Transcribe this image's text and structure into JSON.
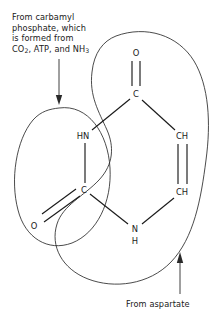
{
  "figure": {
    "background_color": "#ffffff",
    "ink_color": "#1a1a1a"
  },
  "captions": {
    "top": {
      "line1": "From carbamyl",
      "line2": "phosphate, which",
      "line3": "is formed from",
      "line4_pre": "CO",
      "line4_sub1": "2",
      "line4_mid": ", ATP, and NH",
      "line4_sub2": "3"
    },
    "bottom": {
      "text": "From aspartate"
    }
  },
  "structure": {
    "atoms": [
      {
        "id": "O-top",
        "label": "O",
        "x": 136,
        "y": 53
      },
      {
        "id": "C-top",
        "label": "C",
        "x": 136,
        "y": 94
      },
      {
        "id": "HN",
        "label": "HN",
        "x": 83,
        "y": 136
      },
      {
        "id": "C-left",
        "label": "C",
        "x": 84,
        "y": 190
      },
      {
        "id": "O-left",
        "label": "O",
        "x": 34,
        "y": 226
      },
      {
        "id": "CH-up",
        "label": "CH",
        "x": 182,
        "y": 136
      },
      {
        "id": "CH-down",
        "label": "CH",
        "x": 182,
        "y": 192
      },
      {
        "id": "N",
        "label": "N",
        "x": 135,
        "y": 229
      },
      {
        "id": "N-H",
        "label": "H",
        "x": 135,
        "y": 241
      }
    ],
    "bonds": [
      {
        "from": "O-top",
        "to": "C-top",
        "order": 2
      },
      {
        "from": "C-top",
        "to": "HN",
        "order": 1
      },
      {
        "from": "HN",
        "to": "C-left",
        "order": 1
      },
      {
        "from": "C-left",
        "to": "O-left",
        "order": 2
      },
      {
        "from": "C-left",
        "to": "N",
        "order": 1
      },
      {
        "from": "N",
        "to": "CH-down",
        "order": 1
      },
      {
        "from": "CH-down",
        "to": "CH-up",
        "order": 2
      },
      {
        "from": "CH-up",
        "to": "C-top",
        "order": 1
      }
    ]
  },
  "annotations": {
    "carbamyl_region": {
      "name": "carbamyl-phosphate-region",
      "shape": "ellipse",
      "encloses": [
        "HN",
        "C-left",
        "O-left"
      ]
    },
    "aspartate_region": {
      "name": "aspartate-region",
      "shape": "kidney",
      "encloses": [
        "O-top",
        "C-top",
        "CH-up",
        "CH-down",
        "N"
      ]
    },
    "arrow_top": {
      "name": "carbamyl-arrow",
      "direction": "down"
    },
    "arrow_bottom": {
      "name": "aspartate-arrow",
      "direction": "up-left"
    }
  }
}
